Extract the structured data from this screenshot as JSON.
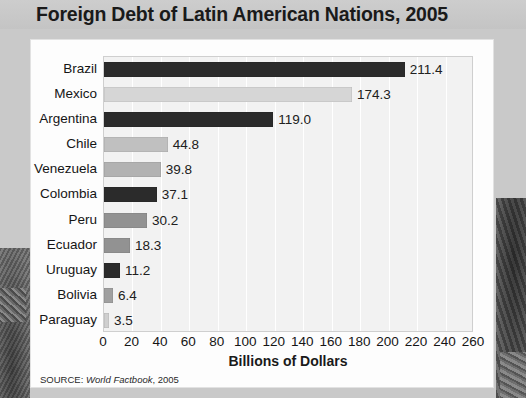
{
  "title": "Foreign Debt of Latin American Nations, 2005",
  "source": {
    "prefix": "SOURCE:",
    "title": "World Factbook",
    "suffix": ", 2005"
  },
  "colors": {
    "page_background": "#c9c9c9",
    "title_band": "#cdcdcd",
    "card": "#fdfdfd",
    "plot_background": "#f2f2f2",
    "gridline": "#ffffff",
    "bar_dark": "#2b2b2b",
    "bar_light": "#d6d6d6",
    "bar_mid_light": "#c0c0c0",
    "bar_mid": "#b2b2b2",
    "bar_gray": "#929292",
    "text": "#151515"
  },
  "chart_data": {
    "type": "bar",
    "orientation": "horizontal",
    "title": "Foreign Debt of Latin American Nations, 2005",
    "xlabel": "Billions of Dollars",
    "ylabel": "",
    "xlim": [
      0,
      260
    ],
    "xticks": [
      0,
      20,
      40,
      60,
      80,
      100,
      120,
      140,
      160,
      180,
      200,
      220,
      240,
      260
    ],
    "grid": "vertical",
    "legend": "none",
    "categories": [
      "Brazil",
      "Mexico",
      "Argentina",
      "Chile",
      "Venezuela",
      "Colombia",
      "Peru",
      "Ecuador",
      "Uruguay",
      "Bolivia",
      "Paraguay"
    ],
    "values": [
      211.4,
      174.3,
      119.0,
      44.8,
      39.8,
      37.1,
      30.2,
      18.3,
      11.2,
      6.4,
      3.5
    ],
    "value_labels": [
      "211.4",
      "174.3",
      "119.0",
      "44.8",
      "39.8",
      "37.1",
      "30.2",
      "18.3",
      "11.2",
      "6.4",
      "3.5"
    ],
    "bar_colors": [
      "#2b2b2b",
      "#d6d6d6",
      "#2b2b2b",
      "#c0c0c0",
      "#b2b2b2",
      "#2b2b2b",
      "#929292",
      "#929292",
      "#2b2b2b",
      "#a0a0a0",
      "#cfcfcf"
    ]
  }
}
